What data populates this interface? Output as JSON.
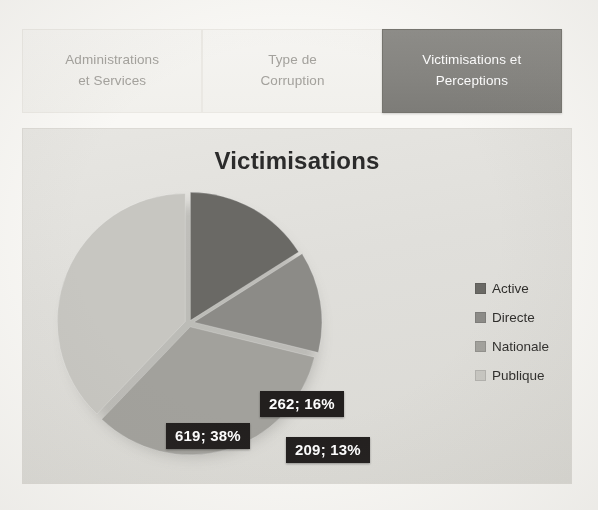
{
  "tabs": [
    {
      "name": "tab-administrations-et-services",
      "line1": "Administrations",
      "line2": "et Services",
      "active": false
    },
    {
      "name": "tab-type-de-corruption",
      "line1": "Type de",
      "line2": "Corruption",
      "active": false
    },
    {
      "name": "tab-victimisations-et-perceptions",
      "line1": "Victimisations et",
      "line2": "Perceptions",
      "active": true
    }
  ],
  "chart_data": {
    "type": "pie",
    "title": "Victimisations",
    "xlabel": "",
    "ylabel": "",
    "legend_position": "right",
    "grid": false,
    "total": 1635,
    "categories": [
      "Active",
      "Directe",
      "Nationale",
      "Publique"
    ],
    "values": [
      262,
      209,
      545,
      619
    ],
    "percents": [
      16,
      13,
      33,
      38
    ],
    "labels": [
      "262; 16%",
      "209; 13%",
      "545; 33%",
      "619; 38%"
    ],
    "colors": [
      "#6b6a66",
      "#8d8c88",
      "#a3a29d",
      "#c9c8c3"
    ],
    "slices": [
      {
        "name": "Active",
        "value": 262,
        "percent": 16,
        "label": "262; 16%",
        "color": "#6b6a66"
      },
      {
        "name": "Directe",
        "value": 209,
        "percent": 13,
        "label": "209; 13%",
        "color": "#8d8c88"
      },
      {
        "name": "Nationale",
        "value": 545,
        "percent": 33,
        "label": "545; 33%",
        "color": "#a3a29d"
      },
      {
        "name": "Publique",
        "value": 619,
        "percent": 38,
        "label": "619; 38%",
        "color": "#c9c8c3"
      }
    ]
  },
  "theme": {
    "page_background": "#fbfaf7",
    "panel_background": "#e4e3df",
    "active_tab_background": "#868581",
    "active_tab_text": "#ffffff",
    "inactive_tab_background": "#f5f4f1",
    "inactive_tab_text": "#a5a39e",
    "label_background": "#221f1e",
    "label_text": "#ffffff",
    "title_color": "#2b2b2b"
  }
}
